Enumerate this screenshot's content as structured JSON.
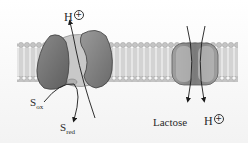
{
  "diagram": {
    "type": "membrane-transport",
    "membrane": {
      "label": "lipid bilayer"
    },
    "left_complex": {
      "name": "redox-driven proton pump",
      "proton_label": {
        "base": "H",
        "charge": "+"
      },
      "substrate_in": {
        "base": "S",
        "sub": "ox"
      },
      "substrate_out": {
        "base": "S",
        "sub": "red"
      }
    },
    "right_complex": {
      "name": "lactose-proton symporter",
      "lactose_label": "Lactose",
      "proton_label": {
        "base": "H",
        "charge": "+"
      }
    },
    "colors": {
      "protein_dark": "#6e6e6e",
      "protein_mid": "#8c8c8c",
      "protein_light": "#b4b4b4",
      "membrane_head": "#c9c9c9",
      "membrane_tail": "#dcdcdc",
      "arrow": "#1a1a1a",
      "text": "#2a2a2a"
    }
  }
}
